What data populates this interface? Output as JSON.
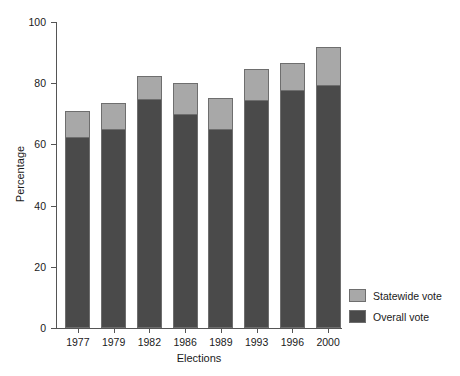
{
  "chart_data": {
    "type": "bar",
    "title": "",
    "subtitle": "",
    "xlabel": "Elections",
    "ylabel": "Percentage",
    "categories": [
      "1977",
      "1979",
      "1982",
      "1986",
      "1989",
      "1993",
      "1996",
      "2000"
    ],
    "ylim": [
      0,
      100
    ],
    "yticks": [
      0,
      20,
      40,
      60,
      80,
      100
    ],
    "ytick_labels": [
      "0",
      "20",
      "40",
      "60",
      "80",
      "100"
    ],
    "grid": false,
    "stacked": true,
    "legend_position": "right",
    "series": [
      {
        "name": "Overall vote",
        "color": "#4a4a4a",
        "values": [
          62.5,
          65.0,
          75.0,
          70.0,
          65.0,
          74.5,
          77.7,
          79.5
        ]
      },
      {
        "name": "Statewide vote",
        "color": "#a8a8a8",
        "values": [
          8.5,
          8.5,
          7.3,
          10.0,
          10.3,
          10.2,
          9.0,
          12.2
        ]
      }
    ],
    "stack_totals": [
      71.0,
      73.5,
      82.3,
      80.0,
      75.3,
      84.7,
      86.7,
      91.7
    ],
    "annotations": []
  },
  "legend": {
    "items": [
      {
        "label": "Statewide vote",
        "color": "#a8a8a8"
      },
      {
        "label": "Overall vote",
        "color": "#4a4a4a"
      }
    ]
  },
  "colors": {
    "statewide": "#a8a8a8",
    "overall": "#4a4a4a",
    "axis": "#555555",
    "bar_outline": "#6e6e6e",
    "background": "#ffffff"
  }
}
